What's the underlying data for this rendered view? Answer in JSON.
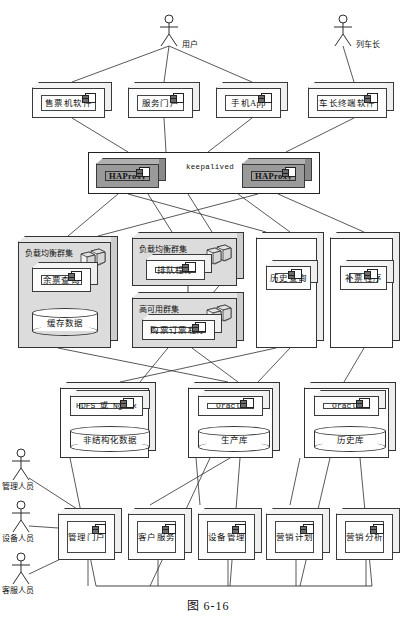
{
  "figure": {
    "caption": "图 6-16"
  },
  "actors": [
    {
      "name": "用户",
      "x": 156,
      "y": 14,
      "label_dx": 26,
      "label_dy": 24
    },
    {
      "name": "列车长",
      "x": 330,
      "y": 14,
      "label_dx": 26,
      "label_dy": 24
    },
    {
      "name": "管理人员",
      "x": 8,
      "y": 448,
      "label_dx": -6,
      "label_dy": 32
    },
    {
      "name": "设备人员",
      "x": 8,
      "y": 500,
      "label_dx": -6,
      "label_dy": 32
    },
    {
      "name": "客服人员",
      "x": 8,
      "y": 552,
      "label_dx": -6,
      "label_dy": 32
    }
  ],
  "client_tier": {
    "nodes": [
      {
        "label": "售票机软件",
        "x": 32,
        "y": 82,
        "w": 80,
        "h": 36
      },
      {
        "label": "服务门户",
        "x": 128,
        "y": 82,
        "w": 72,
        "h": 36
      },
      {
        "label": "手机App",
        "x": 216,
        "y": 82,
        "w": 72,
        "h": 36
      },
      {
        "label": "车长终端软件",
        "x": 308,
        "y": 82,
        "w": 86,
        "h": 36
      }
    ]
  },
  "proxy_tier": {
    "frame": {
      "x": 88,
      "y": 152,
      "w": 232,
      "h": 42
    },
    "link_label": "keepalived",
    "nodes": [
      {
        "label": "HAProxy",
        "x": 96,
        "y": 158,
        "w": 70,
        "h": 30
      },
      {
        "label": "HAProxy",
        "x": 242,
        "y": 158,
        "w": 70,
        "h": 30
      }
    ]
  },
  "app_tier": {
    "clusters": [
      {
        "title": "负载均衡群集",
        "x": 18,
        "y": 236,
        "w": 100,
        "h": 112,
        "gray": true,
        "server_icon": true,
        "component": {
          "label": "余票查询",
          "x": 32,
          "y": 262,
          "w": 66,
          "h": 30
        },
        "cylinder": {
          "label": "缓存数据",
          "x": 32,
          "y": 308,
          "w": 66,
          "h": 28
        }
      },
      {
        "title": "负载均衡群集",
        "x": 132,
        "y": 232,
        "w": 112,
        "h": 54,
        "gray": true,
        "server_icon": true,
        "component": {
          "label": "排队程序",
          "x": 146,
          "y": 254,
          "w": 66,
          "h": 26
        }
      },
      {
        "title": "高可用群集",
        "x": 132,
        "y": 292,
        "w": 112,
        "h": 56,
        "gray": true,
        "server_icon": true,
        "component": {
          "label": "购票订票程序",
          "x": 142,
          "y": 314,
          "w": 80,
          "h": 26
        }
      },
      {
        "title": "",
        "x": 256,
        "y": 232,
        "w": 68,
        "h": 116,
        "gray": false,
        "server_icon": false,
        "component": {
          "label": "历史查询",
          "x": 266,
          "y": 260,
          "w": 52,
          "h": 30
        }
      },
      {
        "title": "",
        "x": 330,
        "y": 232,
        "w": 70,
        "h": 116,
        "gray": false,
        "server_icon": false,
        "component": {
          "label": "补票程序",
          "x": 340,
          "y": 260,
          "w": 54,
          "h": 30
        }
      }
    ]
  },
  "data_tier": {
    "hosts": [
      {
        "x": 60,
        "y": 382,
        "w": 96,
        "h": 76,
        "component": {
          "label": "HDFS 或 Nginx",
          "mono": true,
          "x": 70,
          "y": 390,
          "w": 80,
          "h": 26
        },
        "cylinder": {
          "label": "非结构化数据",
          "x": 70,
          "y": 426,
          "w": 80,
          "h": 26
        }
      },
      {
        "x": 188,
        "y": 382,
        "w": 92,
        "h": 76,
        "component": {
          "label": "Oracle",
          "mono": true,
          "x": 198,
          "y": 390,
          "w": 72,
          "h": 26
        },
        "cylinder": {
          "label": "生产库",
          "x": 198,
          "y": 426,
          "w": 72,
          "h": 26
        }
      },
      {
        "x": 304,
        "y": 382,
        "w": 92,
        "h": 76,
        "component": {
          "label": "Oracle",
          "mono": true,
          "x": 314,
          "y": 390,
          "w": 72,
          "h": 26
        },
        "cylinder": {
          "label": "历史库",
          "x": 314,
          "y": 426,
          "w": 72,
          "h": 26
        }
      }
    ]
  },
  "admin_tier": {
    "nodes": [
      {
        "label": "管理门户",
        "x": 58,
        "y": 508,
        "w": 64,
        "h": 52
      },
      {
        "label": "客户服务",
        "x": 128,
        "y": 508,
        "w": 64,
        "h": 52
      },
      {
        "label": "设备管理",
        "x": 198,
        "y": 508,
        "w": 64,
        "h": 52
      },
      {
        "label": "营销计划",
        "x": 266,
        "y": 508,
        "w": 64,
        "h": 52
      },
      {
        "label": "营销分析",
        "x": 336,
        "y": 508,
        "w": 64,
        "h": 52
      }
    ]
  },
  "colors": {
    "stroke": "#333333",
    "cluster_fill": "#dcdcdc",
    "haproxy_fill": "#9a9a9a",
    "background": "#ffffff"
  }
}
